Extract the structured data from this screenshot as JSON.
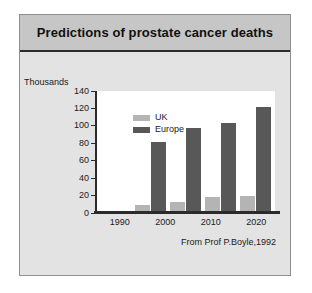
{
  "slide": {
    "title": "Predictions of prostate cancer deaths",
    "attribution": "From Prof P.Boyle,1992"
  },
  "chart_data": {
    "type": "bar",
    "title": "Predictions of prostate cancer deaths",
    "categories": [
      "1990",
      "2000",
      "2010",
      "2020"
    ],
    "series": [
      {
        "name": "UK",
        "values": [
          9,
          13,
          18,
          20
        ],
        "color": "#b4b4b4"
      },
      {
        "name": "Europe",
        "values": [
          81,
          98,
          103,
          122
        ],
        "color": "#585858"
      }
    ],
    "xlabel": "",
    "ylabel": "Thousands",
    "ylim": [
      0,
      140
    ],
    "yticks": [
      140,
      120,
      100,
      80,
      60,
      40,
      20,
      0
    ],
    "grid": false,
    "legend_position": "top-left",
    "annotations": [
      "From Prof P.Boyle,1992"
    ]
  },
  "colors": {
    "panel": "#e3e3e3",
    "title_bar": "#c6c6c6",
    "plot_background": "#ffffff",
    "axis": "#2b2b2b"
  }
}
